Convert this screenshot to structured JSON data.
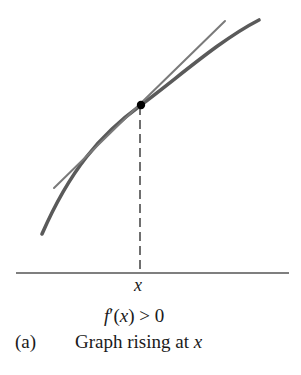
{
  "figure": {
    "part_label": "(a)",
    "caption_text": "Graph rising at ",
    "caption_var": "x",
    "condition": {
      "func": "f",
      "prime": "′",
      "open": "(",
      "var": "x",
      "close": ")",
      "relation": " > 0"
    },
    "axis_point_label": "x",
    "colors": {
      "curve": "#5a5a5a",
      "tangent": "#7a7a7a",
      "point": "#000000",
      "axis": "#555555",
      "dashed": "#333333",
      "text": "#1a1a1a"
    },
    "elements": {
      "curve": "increasing concave-down function graph",
      "tangent": "tangent line at point x with positive slope",
      "point": "point of tangency (x, f(x))",
      "dashed": "vertical dashed line from point down to x-axis",
      "axis": "horizontal x-axis"
    }
  }
}
